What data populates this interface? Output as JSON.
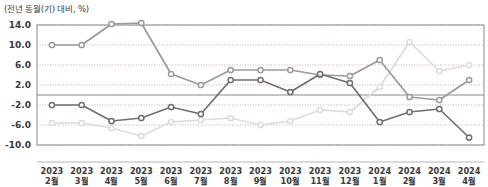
{
  "chart_data": {
    "type": "line",
    "title": "(전년 동월(기) 대비, %)",
    "xlabel": "",
    "ylabel": "",
    "ylim": [
      -10.0,
      14.0
    ],
    "yticks": [
      "14.0",
      "10.0",
      "6.0",
      "2.0",
      "-2.0",
      "-6.0",
      "-10.0"
    ],
    "ytick_values": [
      14.0,
      10.0,
      6.0,
      2.0,
      -2.0,
      -6.0,
      -10.0
    ],
    "grid": true,
    "legend": "none",
    "categories": [
      "2023\n2월",
      "2023\n3월",
      "2023\n4월",
      "2023\n5월",
      "2023\n6월",
      "2023\n7월",
      "2023\n8월",
      "2023\n9월",
      "2023\n10월",
      "2023\n11월",
      "2023\n12월",
      "2024\n1월",
      "2024\n2월",
      "2024\n3월",
      "2024\n4월"
    ],
    "categories_rows": [
      {
        "year": "2023",
        "month": "2월"
      },
      {
        "year": "2023",
        "month": "3월"
      },
      {
        "year": "2023",
        "month": "4월"
      },
      {
        "year": "2023",
        "month": "5월"
      },
      {
        "year": "2023",
        "month": "6월"
      },
      {
        "year": "2023",
        "month": "7월"
      },
      {
        "year": "2023",
        "month": "8월"
      },
      {
        "year": "2023",
        "month": "9월"
      },
      {
        "year": "2023",
        "month": "10월"
      },
      {
        "year": "2023",
        "month": "11월"
      },
      {
        "year": "2023",
        "month": "12월"
      },
      {
        "year": "2024",
        "month": "1월"
      },
      {
        "year": "2024",
        "month": "2월"
      },
      {
        "year": "2024",
        "month": "3월"
      },
      {
        "year": "2024",
        "month": "4월"
      }
    ],
    "series": [
      {
        "name": "series-medium-gray",
        "color": "#9a9a9a",
        "values": [
          10.0,
          10.0,
          14.2,
          14.4,
          4.2,
          2.0,
          5.0,
          5.0,
          5.0,
          4.0,
          3.8,
          7.0,
          -0.4,
          -1.0,
          3.0
        ]
      },
      {
        "name": "series-dark-gray",
        "color": "#6f6f6f",
        "values": [
          -2.0,
          -2.0,
          -5.2,
          -4.6,
          -2.4,
          -3.8,
          3.0,
          3.0,
          0.6,
          4.2,
          2.4,
          -5.4,
          -3.4,
          -2.8,
          -8.5
        ]
      },
      {
        "name": "series-light-gray",
        "color": "#dcdcdc",
        "values": [
          -5.6,
          -5.6,
          -6.6,
          -8.2,
          -5.4,
          -5.0,
          -4.6,
          -6.0,
          -5.2,
          -3.0,
          -3.4,
          1.6,
          10.6,
          4.8,
          6.0
        ]
      }
    ]
  },
  "colors": {
    "grid": "#c9a9a9",
    "axis": "#8a8a8a",
    "zero": "#8a8a8a",
    "text": "#3a3a3a"
  }
}
